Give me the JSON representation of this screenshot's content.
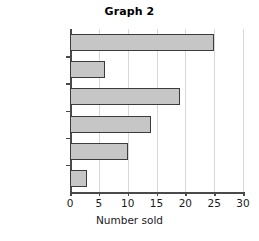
{
  "chart_data": {
    "type": "bar",
    "orientation": "horizontal",
    "title": "Graph 2",
    "xlabel": "Number sold",
    "ylabel": "",
    "categories": [
      "Bags",
      "Jumpers",
      "T-shirts",
      "Skirts",
      "Jeans",
      "Jackets"
    ],
    "values": [
      25,
      6,
      19,
      14,
      10,
      3
    ],
    "xlim": [
      0,
      30
    ],
    "xticks": [
      0,
      5,
      10,
      15,
      20,
      25,
      30
    ],
    "xtick_labels": [
      "0",
      "5",
      "10",
      "15",
      "20",
      "25",
      "30"
    ],
    "grid": true,
    "grid_axis": "x",
    "legend": false,
    "bar_fill_color": "#c6c6c6",
    "bar_edge_color": "#3b3b3b",
    "gridline_color": "#d8d8d8",
    "axis_color": "#4a4a4a",
    "text_color": "#1a1a1a"
  }
}
